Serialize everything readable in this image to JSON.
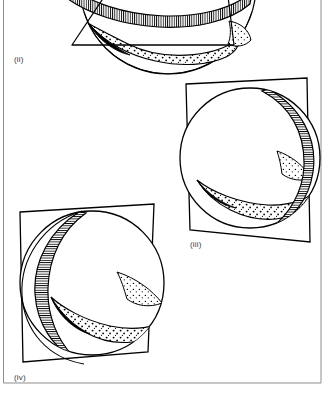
{
  "figure": {
    "background_color": "#ffffff",
    "ink_color": "#000000",
    "frame_color": "#8d8d8d",
    "width": 333,
    "height": 398,
    "frame": {
      "left_x": 3,
      "right_x": 321,
      "bottom_y": 383,
      "visible_edges": "left, right, bottom"
    },
    "panels": [
      {
        "id": "panel-ii",
        "label": "(ii)",
        "label_x": 14,
        "label_y": 62,
        "description": "Sphere cropped by the top image edge, intersected by a triangular planar section; hatched band along the upper cut curve and stippled lune below.",
        "sphere": {
          "cx": 168,
          "cy": -14,
          "r": 88,
          "clipped_top": true
        },
        "plane_shape": "triangle",
        "plane_points": "72,45 115,-22 222,-18 232,44",
        "band_fill": "hatch-vertical",
        "lune_fill": "stipple"
      },
      {
        "id": "panel-iii",
        "label": "(iii)",
        "label_x": 190,
        "label_y": 247,
        "description": "Sphere with a hatched band running from upper right down to lower centre, a stippled crescent lune at the lower left and a small stippled spike at mid right; a quadrilateral plane passes behind the sphere.",
        "sphere": {
          "cx": 250,
          "cy": 158,
          "r": 70
        },
        "plane_shape": "quadrilateral",
        "plane_points": "186,84 307,78 310,242 190,230",
        "band_fill": "hatch-horizontal",
        "lune_fill": "stipple"
      },
      {
        "id": "panel-iv",
        "label": "(iv)",
        "label_x": 14,
        "label_y": 380,
        "description": "Sphere with a wide hatched crescent band on the left side, a stippled lune across the lower middle and a stippled spike pointing right; a quadrilateral plane passes behind the sphere.",
        "sphere": {
          "cx": 92,
          "cy": 283,
          "r": 72
        },
        "plane_shape": "quadrilateral",
        "plane_points": "20,212 154,204 148,352 23,362",
        "band_fill": "hatch-horizontal",
        "lune_fill": "stipple"
      }
    ],
    "legend_notes": {
      "hatched_band": "narrow ruled/hatched strip marking a great-circle band",
      "stippled_region": "dotted lune / spherical wedge region",
      "plane": "outlined flat quadrilateral or triangle cutting the sphere"
    }
  }
}
